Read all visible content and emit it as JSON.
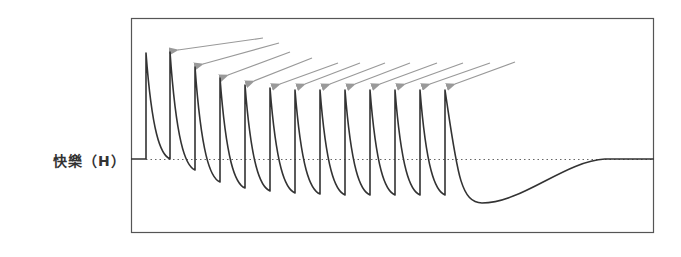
{
  "chart_data": {
    "type": "line",
    "title": "",
    "xlabel": "",
    "ylabel": "快樂（H）",
    "grid": false,
    "baseline_label": "快樂（H）",
    "spikes": [
      {
        "x": 146,
        "peak_y": 53,
        "trough_before_y": 159
      },
      {
        "x": 170,
        "peak_y": 52,
        "trough_before_y": 159
      },
      {
        "x": 195,
        "peak_y": 67,
        "trough_before_y": 170
      },
      {
        "x": 220,
        "peak_y": 78,
        "trough_before_y": 182
      },
      {
        "x": 245,
        "peak_y": 85,
        "trough_before_y": 188
      },
      {
        "x": 270,
        "peak_y": 88,
        "trough_before_y": 191
      },
      {
        "x": 295,
        "peak_y": 90,
        "trough_before_y": 193
      },
      {
        "x": 320,
        "peak_y": 90,
        "trough_before_y": 194
      },
      {
        "x": 345,
        "peak_y": 90,
        "trough_before_y": 195
      },
      {
        "x": 370,
        "peak_y": 90,
        "trough_before_y": 195
      },
      {
        "x": 395,
        "peak_y": 90,
        "trough_before_y": 195
      },
      {
        "x": 420,
        "peak_y": 90,
        "trough_before_y": 195
      },
      {
        "x": 445,
        "peak_y": 90,
        "trough_before_y": 195
      }
    ],
    "after_dip": {
      "min_x": 482,
      "min_y": 203,
      "recover_x": 605,
      "end_y": 159
    },
    "annotations": "12 grey arrows pointing to spike peaks"
  },
  "colors": {
    "line": "#333333",
    "arrow": "#999999",
    "frame": "#555555",
    "baseline": "#666666"
  }
}
